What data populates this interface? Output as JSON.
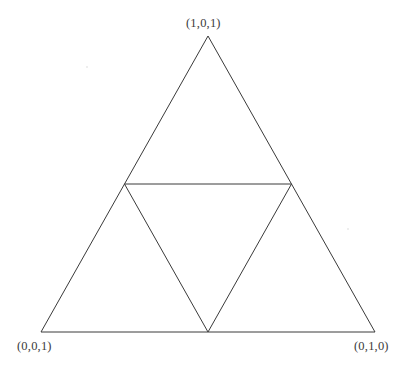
{
  "figure": {
    "kind": "geometric-diagram",
    "background_color": "#ffffff",
    "stroke_color": "#3a3a3a",
    "stroke_width": 1,
    "canvas": {
      "width": 414,
      "height": 371
    }
  },
  "labels": {
    "top": "(1,0,1)",
    "bottom_left": "(0,0,1)",
    "bottom_right": "(0,1,0)"
  },
  "geometry": {
    "outer_triangle": {
      "apex": {
        "x": 208,
        "y": 36
      },
      "bottom_left": {
        "x": 41,
        "y": 332
      },
      "bottom_right": {
        "x": 375,
        "y": 332
      }
    },
    "medial_triangle": {
      "left_midpoint": {
        "x": 124.5,
        "y": 184
      },
      "right_midpoint": {
        "x": 291.5,
        "y": 184
      },
      "bottom_midpoint": {
        "x": 208,
        "y": 332
      }
    },
    "edges": [
      {
        "name": "outer-left-edge",
        "from": "apex",
        "to": "bottom_left"
      },
      {
        "name": "outer-right-edge",
        "from": "apex",
        "to": "bottom_right"
      },
      {
        "name": "outer-base-edge",
        "from": "bottom_left",
        "to": "bottom_right"
      },
      {
        "name": "medial-top-edge",
        "from": "left_midpoint",
        "to": "right_midpoint"
      },
      {
        "name": "medial-left-edge",
        "from": "left_midpoint",
        "to": "bottom_midpoint"
      },
      {
        "name": "medial-right-edge",
        "from": "right_midpoint",
        "to": "bottom_midpoint"
      }
    ]
  }
}
